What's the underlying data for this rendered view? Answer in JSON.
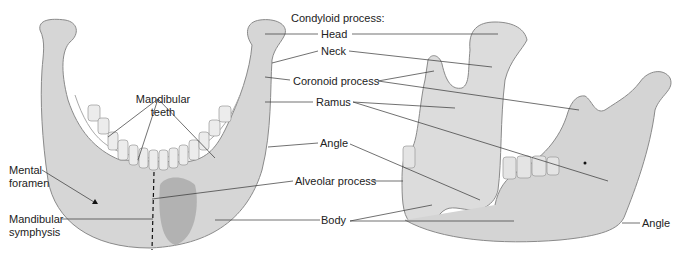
{
  "figure": {
    "views": [
      {
        "id": "anterior",
        "description": "Anterior view of mandible"
      },
      {
        "id": "lateral",
        "description": "Right lateral view of mandible"
      }
    ],
    "colors": {
      "bone": "#d9d9d9",
      "bone_shadow": "#bdbdbd",
      "outline": "#8a8a8a",
      "teeth": "#e8e8e8",
      "leader": "#333333",
      "text": "#222222"
    },
    "labels": {
      "mandibular_teeth_1": "Mandibular",
      "mandibular_teeth_2": "teeth",
      "mental_foramen_1": "Mental",
      "mental_foramen_2": "foramen",
      "mandibular_symphysis_1": "Mandibular",
      "mandibular_symphysis_2": "symphysis",
      "condyloid_process": "Condyloid process:",
      "head": "Head",
      "neck": "Neck",
      "coronoid_process": "Coronoid process",
      "ramus": "Ramus",
      "angle": "Angle",
      "alveolar_process": "Alveolar process",
      "body": "Body",
      "angle_lateral": "Angle"
    }
  }
}
